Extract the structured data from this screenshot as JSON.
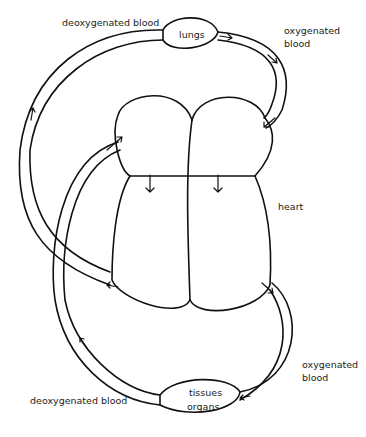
{
  "diagram": {
    "labels": {
      "lungs": "lungs",
      "deoxygenated_top": "deoxygenated blood",
      "oxygenated_top_line1": "oxygenated",
      "oxygenated_top_line2": "blood",
      "heart": "heart",
      "oxygenated_bottom_line1": "oxygenated",
      "oxygenated_bottom_line2": "blood",
      "tissues_line1": "tissues",
      "tissues_line2": "organs",
      "deoxygenated_bottom": "deoxygenated blood"
    },
    "flow": [
      {
        "from": "right heart",
        "to": "lungs",
        "blood": "deoxygenated"
      },
      {
        "from": "lungs",
        "to": "left heart",
        "blood": "oxygenated"
      },
      {
        "from": "left heart",
        "to": "tissues/organs",
        "blood": "oxygenated"
      },
      {
        "from": "tissues/organs",
        "to": "right heart",
        "blood": "deoxygenated"
      }
    ]
  }
}
